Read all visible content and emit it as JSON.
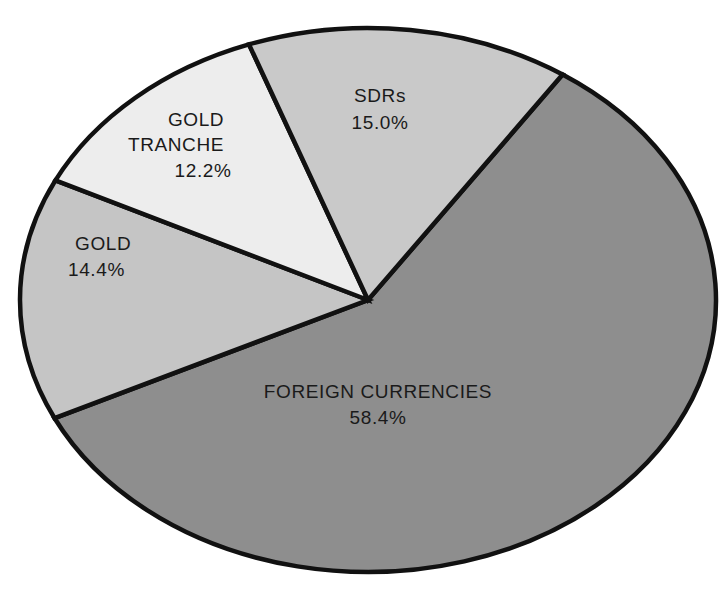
{
  "chart_data": {
    "type": "pie",
    "title": "",
    "subtitle": "",
    "xlabel": "",
    "ylabel": "",
    "legend_position": "none",
    "grid": false,
    "units": "percent",
    "total": 100.0,
    "categories": [
      "FOREIGN CURRENCIES",
      "GOLD",
      "GOLD TRANCHE",
      "SDRs"
    ],
    "values": [
      58.4,
      14.4,
      12.2,
      15.0
    ],
    "slices": [
      {
        "label": "FOREIGN CURRENCIES",
        "value": 58.4,
        "value_label": "58.4%",
        "color": "#8e8e8e",
        "label_x": 378,
        "label_y": 393,
        "value_x": 378,
        "value_y": 419,
        "anchor": "middle"
      },
      {
        "label": "GOLD",
        "value": 14.4,
        "value_label": "14.4%",
        "color": "#c5c5c5",
        "label_x": 75,
        "label_y": 245,
        "value_x": 68,
        "value_y": 271,
        "anchor": "start"
      },
      {
        "label": "GOLD TRANCHE",
        "value": 12.2,
        "value_label": "12.2%",
        "color": "#ededed",
        "label_x": 196,
        "label_y": 121,
        "label_line2": "TRANCHE",
        "label_line2_x": 176,
        "label_line2_y": 146,
        "value_x": 203,
        "value_y": 172,
        "anchor": "middle"
      },
      {
        "label": "SDRs",
        "value": 15.0,
        "value_label": "15.0%",
        "color": "#c9c9c9",
        "label_x": 380,
        "label_y": 97,
        "value_x": 380,
        "value_y": 124,
        "anchor": "middle"
      }
    ],
    "geometry": {
      "center_x": 368,
      "center_y": 300,
      "radius_x": 348,
      "radius_y": 272,
      "start_angle_deg": -56,
      "direction": "clockwise",
      "outline_color": "#111111",
      "outline_width": 4.5
    }
  }
}
